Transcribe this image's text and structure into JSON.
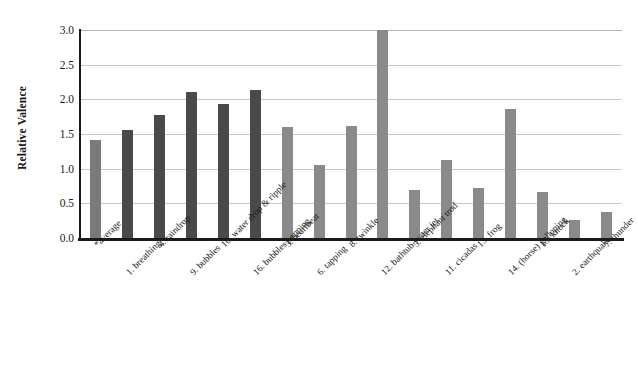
{
  "chart_data": {
    "type": "bar",
    "title": "",
    "xlabel": "",
    "ylabel": "Relative Valence",
    "ylim": [
      0,
      3.0
    ],
    "ytick_labels": [
      "3.0",
      "2.5",
      "2.0",
      "1.5",
      "1.0",
      "0.5",
      "0.0"
    ],
    "ytick_values": [
      3.0,
      2.5,
      2.0,
      1.5,
      1.0,
      0.5,
      0.0
    ],
    "grid": true,
    "legend": "none",
    "categories": [
      "*average",
      "1. breathing",
      "4. raindrop",
      "9. bubbles",
      "10. water drop & ripple",
      "16. bubbles popping",
      "3. heartbeat",
      "6. tapping",
      "8. twinkle",
      "12. bathtub water jet",
      "5. elephant trod",
      "11. cicadas",
      "13. frog",
      "14. (horse) galloping",
      "15. knock",
      "2. earthquake",
      "7. thunder"
    ],
    "values": [
      1.41,
      1.56,
      1.77,
      2.11,
      1.94,
      2.13,
      1.6,
      1.06,
      1.62,
      3.0,
      0.69,
      1.12,
      0.72,
      1.86,
      0.66,
      0.26,
      0.38
    ],
    "bar_colors": [
      "#7a7a7a",
      "#4a4a4a",
      "#4a4a4a",
      "#4a4a4a",
      "#4a4a4a",
      "#4a4a4a",
      "#8a8a8a",
      "#8a8a8a",
      "#8a8a8a",
      "#8a8a8a",
      "#8a8a8a",
      "#8a8a8a",
      "#8a8a8a",
      "#8a8a8a",
      "#8a8a8a",
      "#8a8a8a",
      "#8a8a8a"
    ],
    "axis_color": "#1a1a1a",
    "gridline_color": "#c8c8c8",
    "background": "#ffffff"
  }
}
